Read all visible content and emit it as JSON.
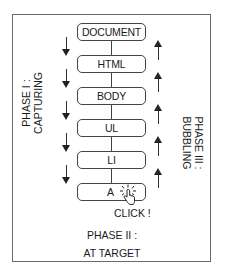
{
  "diagram": {
    "nodes": [
      {
        "label": "DOCUMENT"
      },
      {
        "label": "HTML"
      },
      {
        "label": "BODY"
      },
      {
        "label": "UL"
      },
      {
        "label": "LI"
      },
      {
        "label": "A"
      }
    ],
    "phases": {
      "capturing": {
        "line1": "PHASE I :",
        "line2": "CAPTURING",
        "direction": "down"
      },
      "target": {
        "line1": "PHASE II :",
        "line2": "AT TARGET"
      },
      "bubbling": {
        "line1": "PHASE III :",
        "line2": "BUBBLING",
        "direction": "up"
      }
    },
    "click_label": "CLICK !",
    "icons": {
      "cursor": "pointer-hand-click-icon",
      "down_arrow": "arrow-down-icon",
      "up_arrow": "arrow-up-icon"
    },
    "colors": {
      "line": "#444444",
      "frame": "#6a6a6a",
      "text": "#1a1a1a",
      "background": "#ffffff"
    }
  }
}
